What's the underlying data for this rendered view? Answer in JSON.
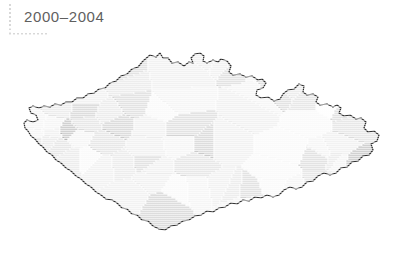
{
  "figure": {
    "title": "2000–2004",
    "background_color": "#ffffff",
    "title_color": "#5f5f5f",
    "decoration": {
      "name": "dotted-corner-rule",
      "color": "#d8d8d8"
    }
  },
  "chart_data": {
    "type": "map",
    "subtype": "choropleth",
    "title": "2000–2004",
    "region": "Czech Republic",
    "unit": "district (okres)",
    "legend": null,
    "grid": false,
    "outline_color": "#2b2b2b",
    "border_color": "#ffffff",
    "color_scale": {
      "type": "sequential-grayscale",
      "low": "#fdfdfd",
      "high": "#8f8f8f",
      "levels": [
        "#fdfdfd",
        "#f4f4f4",
        "#ebebeb",
        "#e2e2e2",
        "#d6d6d6",
        "#c9c9c9",
        "#bdbdbd",
        "#b0b0b0",
        "#a2a2a2",
        "#949494",
        "#8c8c8c"
      ]
    },
    "regions": [
      {
        "name": "Cheb",
        "value": 2,
        "fill": "#ebebeb"
      },
      {
        "name": "Sokolov",
        "value": 9,
        "fill": "#949494"
      },
      {
        "name": "Karlovy Vary",
        "value": 7,
        "fill": "#b0b0b0"
      },
      {
        "name": "Chomutov",
        "value": 6,
        "fill": "#bdbdbd"
      },
      {
        "name": "Most",
        "value": 7,
        "fill": "#b0b0b0"
      },
      {
        "name": "Teplice",
        "value": 6,
        "fill": "#bdbdbd"
      },
      {
        "name": "Ústí nad Labem",
        "value": 5,
        "fill": "#c9c9c9"
      },
      {
        "name": "Děčín",
        "value": 6,
        "fill": "#bdbdbd"
      },
      {
        "name": "Česká Lípa",
        "value": 1,
        "fill": "#f4f4f4"
      },
      {
        "name": "Liberec",
        "value": 5,
        "fill": "#c9c9c9"
      },
      {
        "name": "Jablonec nad Nisou",
        "value": 9,
        "fill": "#949494"
      },
      {
        "name": "Semily",
        "value": 3,
        "fill": "#e2e2e2"
      },
      {
        "name": "Trutnov",
        "value": 2,
        "fill": "#ebebeb"
      },
      {
        "name": "Náchod",
        "value": 1,
        "fill": "#f4f4f4"
      },
      {
        "name": "Jicín",
        "value": 4,
        "fill": "#d6d6d6"
      },
      {
        "name": "Hradec Králové",
        "value": 3,
        "fill": "#e2e2e2"
      },
      {
        "name": "Rychnov nad Kněžnou",
        "value": 1,
        "fill": "#f4f4f4"
      },
      {
        "name": "Pardubice",
        "value": 3,
        "fill": "#e2e2e2"
      },
      {
        "name": "Chrudim",
        "value": 2,
        "fill": "#ebebeb"
      },
      {
        "name": "Ústí nad Orlicí",
        "value": 1,
        "fill": "#f4f4f4"
      },
      {
        "name": "Svitavy",
        "value": 1,
        "fill": "#f4f4f4"
      },
      {
        "name": "Litoměřice",
        "value": 4,
        "fill": "#d6d6d6"
      },
      {
        "name": "Louny",
        "value": 2,
        "fill": "#ebebeb"
      },
      {
        "name": "Rakovník",
        "value": 4,
        "fill": "#d6d6d6"
      },
      {
        "name": "Kladno",
        "value": 5,
        "fill": "#c9c9c9"
      },
      {
        "name": "Mělník",
        "value": 4,
        "fill": "#d6d6d6"
      },
      {
        "name": "Mladá Boleslav",
        "value": 1,
        "fill": "#f4f4f4"
      },
      {
        "name": "Nymburk",
        "value": 3,
        "fill": "#e2e2e2"
      },
      {
        "name": "Kolín",
        "value": 3,
        "fill": "#e2e2e2"
      },
      {
        "name": "Kutná Hora",
        "value": 2,
        "fill": "#ebebeb"
      },
      {
        "name": "Praha",
        "value": 4,
        "fill": "#d6d6d6"
      },
      {
        "name": "Praha-východ",
        "value": 2,
        "fill": "#ebebeb"
      },
      {
        "name": "Praha-západ",
        "value": 2,
        "fill": "#ebebeb"
      },
      {
        "name": "Beroun",
        "value": 5,
        "fill": "#c9c9c9"
      },
      {
        "name": "Plzeň-sever",
        "value": 4,
        "fill": "#d6d6d6"
      },
      {
        "name": "Plzeň-město",
        "value": 2,
        "fill": "#ebebeb"
      },
      {
        "name": "Plzeň-jih",
        "value": 3,
        "fill": "#e2e2e2"
      },
      {
        "name": "Tachov",
        "value": 3,
        "fill": "#e2e2e2"
      },
      {
        "name": "Domažlice",
        "value": 2,
        "fill": "#ebebeb"
      },
      {
        "name": "Klatovy",
        "value": 3,
        "fill": "#e2e2e2"
      },
      {
        "name": "Rokycany",
        "value": 6,
        "fill": "#bdbdbd"
      },
      {
        "name": "Příbram",
        "value": 6,
        "fill": "#bdbdbd"
      },
      {
        "name": "Benešov",
        "value": 6,
        "fill": "#bdbdbd"
      },
      {
        "name": "Havlíčkův Brod",
        "value": 5,
        "fill": "#c9c9c9"
      },
      {
        "name": "Tábor",
        "value": 6,
        "fill": "#bdbdbd"
      },
      {
        "name": "Pelhřimov",
        "value": 5,
        "fill": "#c9c9c9"
      },
      {
        "name": "Jihlava",
        "value": 3,
        "fill": "#e2e2e2"
      },
      {
        "name": "Třebíč",
        "value": 4,
        "fill": "#d6d6d6"
      },
      {
        "name": "Žďár nad Sázavou",
        "value": 3,
        "fill": "#e2e2e2"
      },
      {
        "name": "Strakonice",
        "value": 5,
        "fill": "#c9c9c9"
      },
      {
        "name": "Písek",
        "value": 7,
        "fill": "#b0b0b0"
      },
      {
        "name": "Prachatice",
        "value": 1,
        "fill": "#f4f4f4"
      },
      {
        "name": "České Budějovice",
        "value": 1,
        "fill": "#f4f4f4"
      },
      {
        "name": "Český Krumlov",
        "value": 0,
        "fill": "#fdfdfd"
      },
      {
        "name": "Jindřichův Hradec",
        "value": 3,
        "fill": "#e2e2e2"
      },
      {
        "name": "Znojmo",
        "value": 2,
        "fill": "#ebebeb"
      },
      {
        "name": "Brno-venkov",
        "value": 4,
        "fill": "#d6d6d6"
      },
      {
        "name": "Brno-město",
        "value": 5,
        "fill": "#c9c9c9"
      },
      {
        "name": "Blansko",
        "value": 7,
        "fill": "#b0b0b0"
      },
      {
        "name": "Vyškov",
        "value": 3,
        "fill": "#e2e2e2"
      },
      {
        "name": "Břeclav",
        "value": 2,
        "fill": "#ebebeb"
      },
      {
        "name": "Hodonín",
        "value": 3,
        "fill": "#e2e2e2"
      },
      {
        "name": "Uherské Hradiště",
        "value": 2,
        "fill": "#ebebeb"
      },
      {
        "name": "Zlín",
        "value": 3,
        "fill": "#e2e2e2"
      },
      {
        "name": "Kroměříž",
        "value": 4,
        "fill": "#d6d6d6"
      },
      {
        "name": "Prostějov",
        "value": 6,
        "fill": "#bdbdbd"
      },
      {
        "name": "Olomouc",
        "value": 2,
        "fill": "#ebebeb"
      },
      {
        "name": "Přerov",
        "value": 3,
        "fill": "#e2e2e2"
      },
      {
        "name": "Šumperk",
        "value": 3,
        "fill": "#e2e2e2"
      },
      {
        "name": "Jeseník",
        "value": 6,
        "fill": "#bdbdbd"
      },
      {
        "name": "Bruntal",
        "value": 6,
        "fill": "#bdbdbd"
      },
      {
        "name": "Opava",
        "value": 2,
        "fill": "#ebebeb"
      },
      {
        "name": "Nový Jičín",
        "value": 4,
        "fill": "#d6d6d6"
      },
      {
        "name": "Ostrava-město",
        "value": 3,
        "fill": "#e2e2e2"
      },
      {
        "name": "Karviná",
        "value": 2,
        "fill": "#ebebeb"
      },
      {
        "name": "Frýdek-Místek",
        "value": 5,
        "fill": "#c9c9c9"
      },
      {
        "name": "Vsetín",
        "value": 2,
        "fill": "#ebebeb"
      }
    ]
  }
}
